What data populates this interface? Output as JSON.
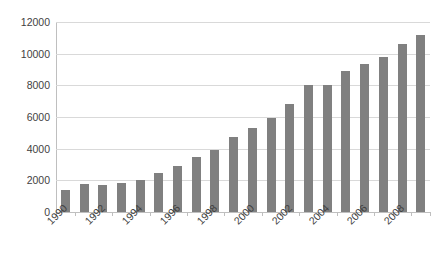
{
  "chart_data": {
    "type": "bar",
    "title": "",
    "subtitle": "",
    "xlabel": "",
    "ylabel": "",
    "grid": true,
    "legend": null,
    "legend_position": "none",
    "bar_color": "#808080",
    "gridline_color": "#d9d9d9",
    "axis_color": "#bfbfbf",
    "text_color": "#3f3f3f",
    "ylim": [
      0,
      12000
    ],
    "y_ticks": [
      12000,
      10000,
      8000,
      6000,
      4000,
      2000,
      0
    ],
    "y_tick_labels": [
      "12000",
      "10000",
      "8000",
      "6000",
      "4000",
      "2000",
      "0"
    ],
    "x_tick_labels": [
      "1990",
      "1992",
      "1994",
      "1996",
      "1998",
      "2000",
      "2002",
      "2004",
      "2006",
      "2008"
    ],
    "x_tick_label_rotation": 45,
    "x_tick_label_step": 2,
    "categories": [
      "1990",
      "1991",
      "1992",
      "1993",
      "1994",
      "1995",
      "1996",
      "1997",
      "1998",
      "1999",
      "2000",
      "2001",
      "2002",
      "2003",
      "2004",
      "2005",
      "2006",
      "2007",
      "2008",
      "2009"
    ],
    "values": [
      1400,
      1750,
      1700,
      1850,
      2000,
      2450,
      2900,
      3500,
      3900,
      4750,
      5300,
      5950,
      6800,
      8050,
      8050,
      8900,
      9350,
      9800,
      10600,
      11200
    ]
  }
}
